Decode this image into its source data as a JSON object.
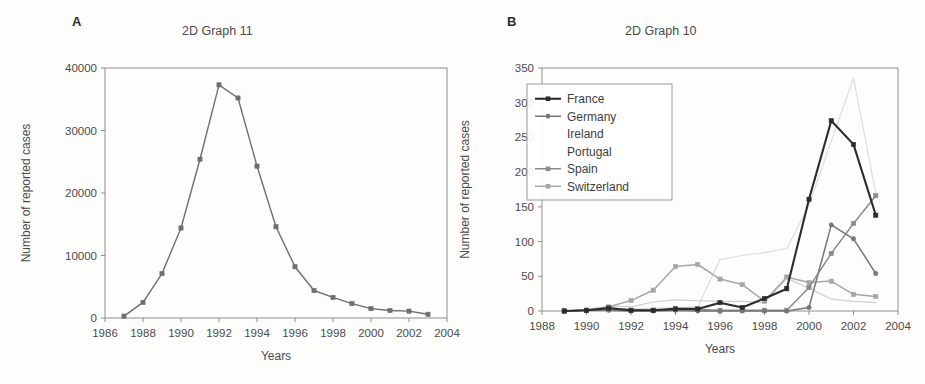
{
  "figure": {
    "panels": [
      {
        "letter": "A",
        "title": "2D Graph 11",
        "xlabel": "Years",
        "ylabel": "Number of reported cases"
      },
      {
        "letter": "B",
        "title": "2D Graph 10",
        "xlabel": "Years",
        "ylabel": "Number of reported cases"
      }
    ]
  },
  "chart_data": [
    {
      "type": "line",
      "panel": "A",
      "title": "2D Graph 11",
      "xlabel": "Years",
      "ylabel": "Number of reported cases",
      "xlim": [
        1986,
        2004
      ],
      "ylim": [
        0,
        40000
      ],
      "xticks": [
        1986,
        1988,
        1990,
        1992,
        1994,
        1996,
        1998,
        2000,
        2002,
        2004
      ],
      "xtick_labels": [
        "1986",
        "1988",
        "1990",
        "1992",
        "1994",
        "1996",
        "1998",
        "2000",
        "2002",
        "2004"
      ],
      "yticks": [
        0,
        10000,
        20000,
        30000,
        40000
      ],
      "ytick_labels": [
        "0",
        "10000",
        "20000",
        "30000",
        "40000"
      ],
      "grid": false,
      "legend": null,
      "series": [
        {
          "name": "reported cases",
          "color": "#6e6e6e",
          "marker": "square",
          "x": [
            1987,
            1988,
            1989,
            1990,
            1991,
            1992,
            1993,
            1994,
            1995,
            1996,
            1997,
            1998,
            1999,
            2000,
            2001,
            2002,
            2003
          ],
          "values": [
            300,
            2500,
            7100,
            14400,
            25400,
            37300,
            35200,
            24300,
            14600,
            8200,
            4400,
            3300,
            2300,
            1500,
            1200,
            1100,
            600
          ]
        }
      ]
    },
    {
      "type": "line",
      "panel": "B",
      "title": "2D Graph 10",
      "xlabel": "Years",
      "ylabel": "Number of reported cases",
      "xlim": [
        1988,
        2004
      ],
      "ylim": [
        0,
        350
      ],
      "xticks": [
        1988,
        1990,
        1992,
        1994,
        1996,
        1998,
        2000,
        2002,
        2004
      ],
      "xtick_labels": [
        "1988",
        "1990",
        "1992",
        "1994",
        "1996",
        "1998",
        "2000",
        "2002",
        "2004"
      ],
      "yticks": [
        0,
        50,
        100,
        150,
        200,
        250,
        300,
        350
      ],
      "ytick_labels": [
        "0",
        "50",
        "100",
        "150",
        "200",
        "250",
        "300",
        "350"
      ],
      "grid": false,
      "legend_position": "upper-left",
      "legend_entries": [
        "France",
        "Germany",
        "Ireland",
        "Portugal",
        "Spain",
        "Switzerland"
      ],
      "series": [
        {
          "name": "France",
          "color": "#2b2b2b",
          "width": 2.1,
          "marker": "square",
          "show_marker_in_legend": true,
          "x": [
            1989,
            1990,
            1991,
            1992,
            1993,
            1994,
            1995,
            1996,
            1997,
            1998,
            1999,
            2000,
            2001,
            2002,
            2003
          ],
          "values": [
            0,
            1,
            4,
            1,
            1,
            3,
            3,
            12,
            5,
            18,
            32,
            161,
            274,
            240,
            138
          ]
        },
        {
          "name": "Germany",
          "color": "#777777",
          "width": 1.5,
          "marker": "circle",
          "show_marker_in_legend": true,
          "x": [
            1989,
            1990,
            1991,
            1992,
            1993,
            1994,
            1995,
            1996,
            1997,
            1998,
            1999,
            2000,
            2001,
            2002,
            2003
          ],
          "values": [
            0,
            1,
            1,
            0,
            0,
            1,
            0,
            0,
            0,
            0,
            0,
            5,
            124,
            104,
            54
          ]
        },
        {
          "name": "Ireland",
          "color": "#dcdcdc",
          "width": 1.2,
          "marker": "none",
          "show_marker_in_legend": false,
          "x": [
            1989,
            1990,
            1991,
            1992,
            1993,
            1994,
            1995,
            1996,
            1997,
            1998,
            1999,
            2000,
            2001,
            2002,
            2003
          ],
          "values": [
            0,
            1,
            2,
            3,
            4,
            5,
            6,
            74,
            80,
            84,
            90,
            152,
            245,
            335,
            170
          ]
        },
        {
          "name": "Portugal",
          "color": "#cfcfcf",
          "width": 1.2,
          "marker": "none",
          "show_marker_in_legend": false,
          "x": [
            1989,
            1990,
            1991,
            1992,
            1993,
            1994,
            1995,
            1996,
            1997,
            1998,
            1999,
            2000,
            2001,
            2002,
            2003
          ],
          "values": [
            0,
            2,
            7,
            6,
            13,
            16,
            15,
            14,
            14,
            12,
            47,
            33,
            17,
            14,
            12
          ]
        },
        {
          "name": "Spain",
          "color": "#8a8a8a",
          "width": 1.5,
          "marker": "square",
          "show_marker_in_legend": true,
          "x": [
            1989,
            1990,
            1991,
            1992,
            1993,
            1994,
            1995,
            1996,
            1997,
            1998,
            1999,
            2000,
            2001,
            2002,
            2003
          ],
          "values": [
            0,
            1,
            5,
            1,
            1,
            3,
            2,
            1,
            1,
            1,
            1,
            34,
            83,
            126,
            166
          ]
        },
        {
          "name": "Switzerland",
          "color": "#a6a6a6",
          "width": 1.5,
          "marker": "square",
          "show_marker_in_legend": true,
          "x": [
            1989,
            1990,
            1991,
            1992,
            1993,
            1994,
            1995,
            1996,
            1997,
            1998,
            1999,
            2000,
            2001,
            2002,
            2003
          ],
          "values": [
            0,
            1,
            6,
            15,
            30,
            64,
            67,
            46,
            38,
            14,
            49,
            41,
            43,
            24,
            21
          ]
        }
      ]
    }
  ]
}
